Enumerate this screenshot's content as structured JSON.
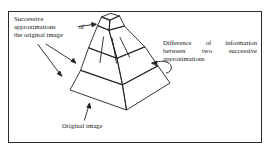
{
  "figure": {
    "kind": "line-drawing",
    "frame": {
      "border_color": "#2b2b2b",
      "background": "#ffffff"
    },
    "stroke_color": "#1f1f1f",
    "labels": {
      "successive": {
        "name": "successive-approximations-label",
        "line1": "Successive",
        "line2": "approximations  of",
        "line3": "the original image",
        "full_text": "Successive approximations of the original image"
      },
      "difference": {
        "name": "difference-of-information-label",
        "line1": "Difference  of  information",
        "line2": "between   two   successive",
        "line3": "approximations",
        "full_text": "Difference of information between two successive approximations"
      },
      "original": {
        "name": "original-image-label",
        "line1": "Original image",
        "full_text": "Original image"
      }
    },
    "pyramid": {
      "tiers": 4,
      "description": "stepped truncated pyramid with visible front-left face, right face and small flat top face",
      "apex_cap": "flat quadrilateral top face"
    },
    "arrows": [
      {
        "name": "arrow-to-upper-tier",
        "style": "straight",
        "direction": "right",
        "from": "successive label",
        "to": "upper pyramid tier"
      },
      {
        "name": "arrow-to-mid-tier",
        "style": "straight",
        "direction": "down-right",
        "from": "successive label",
        "to": "middle pyramid tier"
      },
      {
        "name": "arrow-to-lower-tier",
        "style": "straight",
        "direction": "down-right",
        "from": "successive label",
        "to": "lower pyramid tier"
      },
      {
        "name": "arrow-curved-to-side-face",
        "style": "curved-hook",
        "direction": "left",
        "from": "difference label",
        "to": "pyramid right face band"
      },
      {
        "name": "arrow-to-base",
        "style": "straight",
        "direction": "up-right",
        "from": "original image label",
        "to": "pyramid base edge"
      }
    ]
  }
}
